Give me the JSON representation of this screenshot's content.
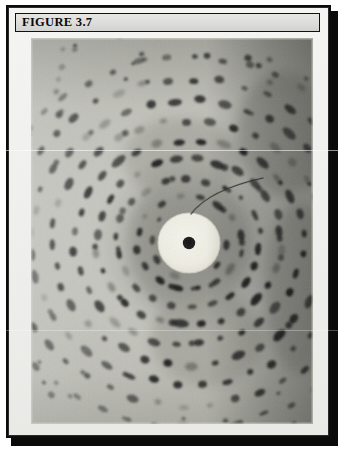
{
  "figure": {
    "label": "FIGURE 3.7",
    "number": "3.7",
    "header_bg": "#dcdcda",
    "frame_border": "#0c0c0c",
    "page_bg": "#ffffff"
  },
  "photograph": {
    "kind": "x-ray-diffraction-photograph",
    "description": "Black and white X-ray diffraction (precession) photograph showing concentric elliptical rings of dark reflection spots radiating from a bright central beam-stop disc",
    "film_base_gray": "#b9b9b2",
    "spot_color": "#171717",
    "beamstop": {
      "center_x_pct": 56,
      "center_y_pct": 53,
      "disc_radius_px": 31,
      "disc_color": "#f0efe6",
      "dot_radius_px": 6,
      "dot_color": "#151515"
    },
    "beamstop_arm": {
      "visible": true,
      "color": "#2b2b2b",
      "description": "thin curved beam-stop support arm sweeping up and to the right from the central disc"
    },
    "vignette": {
      "right_edge": "dark",
      "top_right": "dark",
      "left_edge": "light"
    },
    "rings": [
      {
        "index": 1,
        "rx": 52,
        "ry": 46,
        "spots": 16,
        "spot_size": 6.0,
        "opacity": 0.92
      },
      {
        "index": 2,
        "rx": 72,
        "ry": 64,
        "spots": 22,
        "spot_size": 6.4,
        "opacity": 0.93
      },
      {
        "index": 3,
        "rx": 93,
        "ry": 83,
        "spots": 28,
        "spot_size": 6.6,
        "opacity": 0.94
      },
      {
        "index": 4,
        "rx": 114,
        "ry": 102,
        "spots": 32,
        "spot_size": 6.8,
        "opacity": 0.93
      },
      {
        "index": 5,
        "rx": 136,
        "ry": 122,
        "spots": 36,
        "spot_size": 6.8,
        "opacity": 0.9
      },
      {
        "index": 6,
        "rx": 158,
        "ry": 142,
        "spots": 40,
        "spot_size": 6.6,
        "opacity": 0.86
      },
      {
        "index": 7,
        "rx": 181,
        "ry": 163,
        "spots": 44,
        "spot_size": 6.2,
        "opacity": 0.8
      },
      {
        "index": 8,
        "rx": 205,
        "ry": 185,
        "spots": 46,
        "spot_size": 5.8,
        "opacity": 0.7
      }
    ],
    "inner_rings": [
      {
        "index": 0,
        "rx": 38,
        "ry": 34,
        "spots": 10,
        "spot_size": 5.2,
        "opacity": 0.85
      }
    ]
  }
}
